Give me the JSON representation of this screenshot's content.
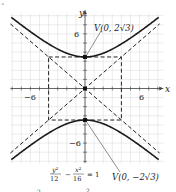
{
  "figure": {
    "equation": {
      "numerator_left": "y²",
      "denominator_left": "12",
      "minus": "−",
      "numerator_right": "x²",
      "denominator_right": "16",
      "equals": "= 1"
    },
    "axes": {
      "x_label": "x",
      "y_label": "y",
      "x_ticks": [
        {
          "value": -6,
          "label": "−6"
        },
        {
          "value": 6,
          "label": "6"
        }
      ],
      "y_ticks": [
        {
          "value": 6,
          "label": "6"
        },
        {
          "value": -6,
          "label": "−6"
        }
      ],
      "range": {
        "x": [
          -8,
          8
        ],
        "y": [
          -8,
          8
        ]
      }
    },
    "vertices": {
      "upper": "V(0, 2√3)",
      "lower": "V(0, −2√3)"
    },
    "fundamental_rectangle": {
      "x": [
        -4,
        4
      ],
      "y": [
        -3.4641,
        3.4641
      ]
    },
    "asymptotes": [
      "y = (√3/2)x",
      "y = −(√3/2)x"
    ],
    "fragments": {
      "top_left_mark": "ˆ",
      "bottom_left_frag": "2",
      "bottom_mid_frag": "2"
    },
    "colors": {
      "curve": "#1a1a1a",
      "grid": "#d8d8d8",
      "axis": "#444444",
      "dashed": "#222222"
    }
  }
}
